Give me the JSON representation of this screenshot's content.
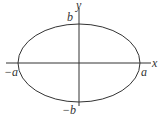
{
  "diagram": {
    "type": "ellipse-on-axes",
    "colors": {
      "stroke": "#333333",
      "background": "#ffffff"
    },
    "axes": {
      "x_label": "x",
      "y_label": "y"
    },
    "ellipse": {
      "semi_major_label_pos": "a",
      "semi_major_label_neg": "−a",
      "semi_minor_label_pos": "b",
      "semi_minor_label_neg": "−b"
    }
  }
}
